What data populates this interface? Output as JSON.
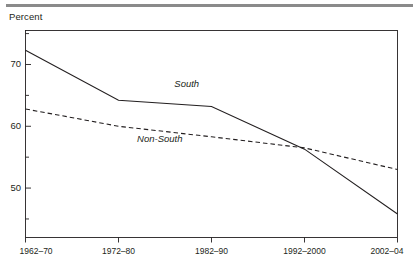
{
  "figure": {
    "ylabel_text": "Percent",
    "top_rule": "horizontal-rule"
  },
  "chart_data": {
    "type": "line",
    "title": "",
    "subtitle": "",
    "xlabel": "",
    "ylabel": "Percent",
    "categories": [
      "1962–70",
      "1972–80",
      "1982–90",
      "1992–2000",
      "2002–04"
    ],
    "series": [
      {
        "name": "South",
        "style": "solid",
        "color": "#231f20",
        "values": [
          72.3,
          64.2,
          63.2,
          56.3,
          45.8
        ]
      },
      {
        "name": "Non-South",
        "style": "dashed",
        "color": "#231f20",
        "values": [
          62.8,
          60.0,
          58.3,
          56.5,
          53.0
        ]
      }
    ],
    "ylim": [
      42.0,
      75.5
    ],
    "yticks_major": [
      50,
      60,
      70
    ],
    "yticks_major_labels": [
      "50",
      "60",
      "70"
    ],
    "yticks_minor": [
      45,
      55,
      65,
      75
    ],
    "xlim_categories": 5,
    "grid": false,
    "legend": "inline-annotations",
    "annotations": [
      {
        "text": "South",
        "x_frac": 0.4,
        "value": 66.8
      },
      {
        "text": "Non-South",
        "x_frac": 0.3,
        "value": 58.0
      }
    ]
  }
}
